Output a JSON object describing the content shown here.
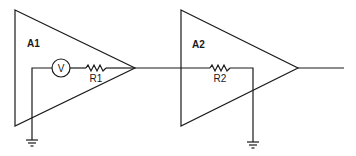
{
  "diagram": {
    "type": "circuit-schematic",
    "colors": {
      "stroke": "#1a1a1a",
      "background": "#ffffff"
    },
    "amplifiers": [
      {
        "id": "A1",
        "label": "A1"
      },
      {
        "id": "A2",
        "label": "A2"
      }
    ],
    "components": {
      "voltmeter": {
        "label": "V",
        "icon": "voltmeter-icon"
      },
      "r1": {
        "label": "R1",
        "icon": "resistor-icon"
      },
      "r2": {
        "label": "R2",
        "icon": "resistor-icon"
      }
    },
    "grounds": [
      {
        "id": "gnd1",
        "icon": "ground-icon"
      },
      {
        "id": "gnd2",
        "icon": "ground-icon"
      }
    ]
  }
}
